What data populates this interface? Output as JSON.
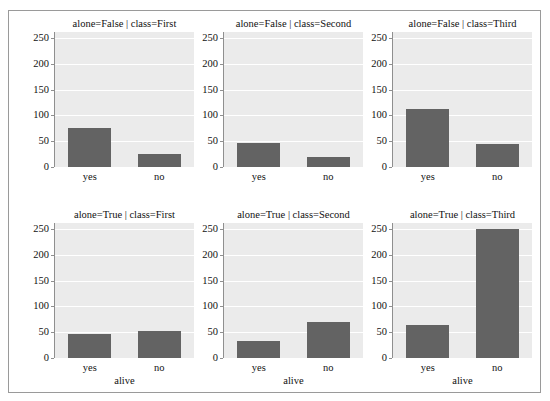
{
  "figure": {
    "clipped_header_text": "· · ·   · · ·",
    "background": "#ffffff",
    "frame_color": "#9a9a9a"
  },
  "style": {
    "bar_color": "#636363",
    "panel_background": "#ebebeb",
    "gridline_color": "#ffffff",
    "axis_color": "#8f8f8f",
    "text_color": "#111111"
  },
  "chart_data": {
    "type": "bar",
    "title": "",
    "xlabel": "alive",
    "ylabel": "",
    "categories": [
      "yes",
      "no"
    ],
    "ylim": [
      0,
      262
    ],
    "yticks": [
      0,
      50,
      100,
      150,
      200,
      250
    ],
    "ytick_labels": [
      "0",
      "50",
      "100",
      "150",
      "200",
      "250"
    ],
    "grid": true,
    "legend": "none",
    "facet_rows": [
      "alone=False",
      "alone=True"
    ],
    "facet_cols": [
      "class=First",
      "class=Second",
      "class=Third"
    ],
    "panels": [
      {
        "title": "alone=False | class=First",
        "row": 0,
        "col": 0,
        "categories": [
          "yes",
          "no"
        ],
        "values": [
          75,
          25
        ],
        "xlabel": "",
        "show_ytick_labels": true
      },
      {
        "title": "alone=False | class=Second",
        "row": 0,
        "col": 1,
        "categories": [
          "yes",
          "no"
        ],
        "values": [
          47,
          20
        ],
        "xlabel": "",
        "show_ytick_labels": true
      },
      {
        "title": "alone=False | class=Third",
        "row": 0,
        "col": 2,
        "categories": [
          "yes",
          "no"
        ],
        "values": [
          112,
          45
        ],
        "xlabel": "",
        "show_ytick_labels": true
      },
      {
        "title": "alone=True | class=First",
        "row": 1,
        "col": 0,
        "categories": [
          "yes",
          "no"
        ],
        "values": [
          46,
          53
        ],
        "xlabel": "alive",
        "show_ytick_labels": true
      },
      {
        "title": "alone=True | class=Second",
        "row": 1,
        "col": 1,
        "categories": [
          "yes",
          "no"
        ],
        "values": [
          33,
          70
        ],
        "xlabel": "alive",
        "show_ytick_labels": true
      },
      {
        "title": "alone=True | class=Third",
        "row": 1,
        "col": 2,
        "categories": [
          "yes",
          "no"
        ],
        "values": [
          64,
          250
        ],
        "xlabel": "alive",
        "show_ytick_labels": true
      }
    ]
  }
}
